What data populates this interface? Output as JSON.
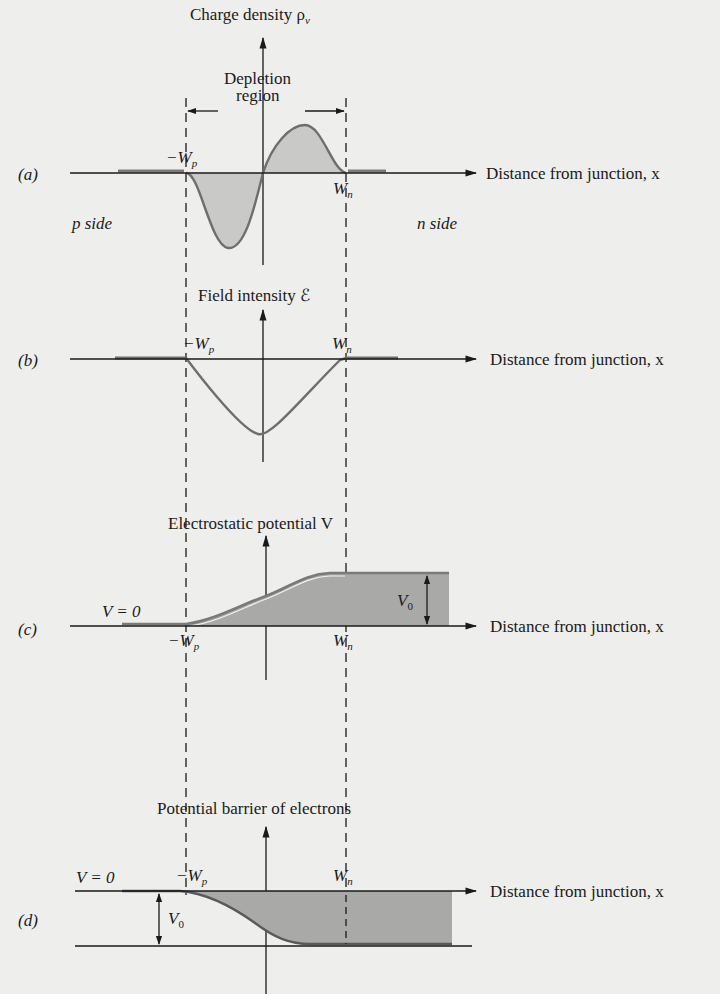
{
  "figure": {
    "depletion_label_line1": "Depletion",
    "depletion_label_line2": "region",
    "x_axis_label": "Distance from junction, x",
    "boundary_left": "−W",
    "boundary_left_sub": "p",
    "boundary_right": "W",
    "boundary_right_sub": "n"
  },
  "panels": [
    {
      "id": "a",
      "tag": "(a)",
      "y_axis_label": "Charge density ρ",
      "y_axis_sub": "v",
      "left_side_label": "p side",
      "right_side_label": "n side"
    },
    {
      "id": "b",
      "tag": "(b)",
      "y_axis_label": "Field intensity ℰ"
    },
    {
      "id": "c",
      "tag": "(c)",
      "y_axis_label": "Electrostatic potential V",
      "ref_label": "V = 0",
      "height_label": "V",
      "height_sub": "0"
    },
    {
      "id": "d",
      "tag": "(d)",
      "y_axis_label": "Potential barrier of electrons",
      "ref_label": "V = 0",
      "height_label": "V",
      "height_sub": "0"
    }
  ],
  "colors": {
    "background": "#eeeeec",
    "ink": "#1a1a1a",
    "curve": "#6e6e6e",
    "fill_light": "#c9c9c7",
    "fill_dark": "#a9a9a7"
  }
}
